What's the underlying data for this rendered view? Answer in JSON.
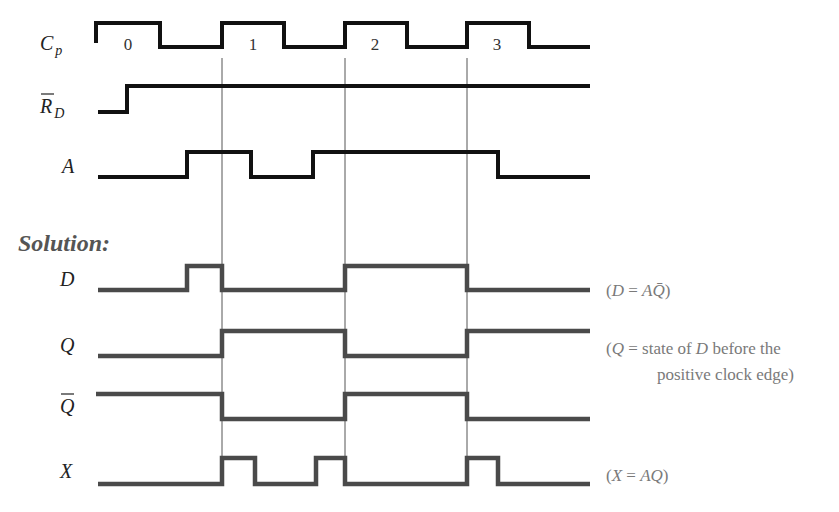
{
  "diagram": {
    "type": "timing_diagram",
    "colors": {
      "input_wave": "#111111",
      "solution_wave": "#4a4a4a",
      "guide_line": "#555555",
      "annotation": "#7a7a7a",
      "heading": "#555555"
    },
    "clock_edges_x": [
      222,
      345,
      467
    ],
    "guide_line_y": [
      58,
      486
    ],
    "clock_cycle_labels": [
      {
        "text": "0",
        "x": 128,
        "y": 50
      },
      {
        "text": "1",
        "x": 253,
        "y": 50
      },
      {
        "text": "2",
        "x": 375,
        "y": 50
      },
      {
        "text": "3",
        "x": 497,
        "y": 50
      }
    ],
    "heading": {
      "text": "Solution:",
      "x": 18,
      "y": 251
    },
    "signals": [
      {
        "id": "cp",
        "group": "input",
        "label": "C",
        "label_sub": "p",
        "label_overbar": false,
        "label_x": 40,
        "label_y": 50,
        "high_y": 23,
        "low_y": 47,
        "points": [
          [
            96,
            43
          ],
          [
            96,
            23
          ],
          [
            160,
            23
          ],
          [
            160,
            47
          ],
          [
            222,
            47
          ],
          [
            222,
            23
          ],
          [
            284,
            23
          ],
          [
            284,
            47
          ],
          [
            345,
            47
          ],
          [
            345,
            23
          ],
          [
            407,
            23
          ],
          [
            407,
            47
          ],
          [
            467,
            47
          ],
          [
            467,
            23
          ],
          [
            529,
            23
          ],
          [
            529,
            47
          ],
          [
            590,
            47
          ]
        ]
      },
      {
        "id": "rd_bar",
        "group": "input",
        "label": "R",
        "label_sub": "D",
        "label_overbar": true,
        "label_x": 40,
        "label_y": 113,
        "high_y": 86,
        "low_y": 112,
        "points": [
          [
            98,
            112
          ],
          [
            127,
            112
          ],
          [
            127,
            86
          ],
          [
            590,
            86
          ]
        ]
      },
      {
        "id": "a",
        "group": "input",
        "label": "A",
        "label_sub": "",
        "label_overbar": false,
        "label_x": 62,
        "label_y": 173,
        "high_y": 152,
        "low_y": 177,
        "points": [
          [
            98,
            177
          ],
          [
            187,
            177
          ],
          [
            187,
            152
          ],
          [
            251,
            152
          ],
          [
            251,
            177
          ],
          [
            313,
            177
          ],
          [
            313,
            152
          ],
          [
            498,
            152
          ],
          [
            498,
            177
          ],
          [
            590,
            177
          ]
        ]
      },
      {
        "id": "d",
        "group": "solution",
        "label": "D",
        "label_sub": "",
        "label_overbar": false,
        "label_x": 60,
        "label_y": 286,
        "high_y": 266,
        "low_y": 290,
        "points": [
          [
            98,
            290
          ],
          [
            187,
            290
          ],
          [
            187,
            266
          ],
          [
            222,
            266
          ],
          [
            222,
            290
          ],
          [
            345,
            290
          ],
          [
            345,
            266
          ],
          [
            467,
            266
          ],
          [
            467,
            290
          ],
          [
            590,
            290
          ]
        ]
      },
      {
        "id": "q",
        "group": "solution",
        "label": "Q",
        "label_sub": "",
        "label_overbar": false,
        "label_x": 60,
        "label_y": 352,
        "high_y": 331,
        "low_y": 356,
        "points": [
          [
            98,
            356
          ],
          [
            222,
            356
          ],
          [
            222,
            331
          ],
          [
            345,
            331
          ],
          [
            345,
            356
          ],
          [
            467,
            356
          ],
          [
            467,
            331
          ],
          [
            590,
            331
          ]
        ]
      },
      {
        "id": "q_bar",
        "group": "solution",
        "label": "Q",
        "label_sub": "",
        "label_overbar": true,
        "label_x": 60,
        "label_y": 413,
        "high_y": 394,
        "low_y": 419,
        "points": [
          [
            96,
            394
          ],
          [
            222,
            394
          ],
          [
            222,
            419
          ],
          [
            345,
            419
          ],
          [
            345,
            394
          ],
          [
            467,
            394
          ],
          [
            467,
            419
          ],
          [
            590,
            419
          ]
        ]
      },
      {
        "id": "x",
        "group": "solution",
        "label": "X",
        "label_sub": "",
        "label_overbar": false,
        "label_x": 60,
        "label_y": 478,
        "high_y": 458,
        "low_y": 484,
        "points": [
          [
            98,
            484
          ],
          [
            222,
            484
          ],
          [
            222,
            458
          ],
          [
            255,
            458
          ],
          [
            255,
            484
          ],
          [
            316,
            484
          ],
          [
            316,
            458
          ],
          [
            345,
            458
          ],
          [
            345,
            484
          ],
          [
            467,
            484
          ],
          [
            467,
            458
          ],
          [
            498,
            458
          ],
          [
            498,
            484
          ],
          [
            590,
            484
          ]
        ]
      }
    ],
    "annotations": [
      {
        "id": "d-eq",
        "x": 606,
        "y": 296,
        "lines": [
          "(D = AQ̄)"
        ],
        "parts": [
          [
            "(",
            false
          ],
          [
            "D",
            true
          ],
          [
            " = ",
            false
          ],
          [
            "A",
            true
          ],
          [
            "Q̄",
            true
          ],
          [
            ")",
            false
          ]
        ]
      },
      {
        "id": "q-eq",
        "x": 606,
        "y": 354,
        "parts": [
          [
            "(",
            false
          ],
          [
            "Q",
            true
          ],
          [
            " = state of ",
            false
          ],
          [
            "D",
            true
          ],
          [
            " before the",
            false
          ]
        ]
      },
      {
        "id": "q-eq-2",
        "x": 657,
        "y": 380,
        "parts": [
          [
            "positive clock edge)",
            false
          ]
        ]
      },
      {
        "id": "x-eq",
        "x": 606,
        "y": 481,
        "parts": [
          [
            "(",
            false
          ],
          [
            "X",
            true
          ],
          [
            " = ",
            false
          ],
          [
            "A",
            true
          ],
          [
            "Q",
            true
          ],
          [
            ")",
            false
          ]
        ]
      }
    ]
  },
  "text": {
    "heading": "Solution:",
    "cycle_0": "0",
    "cycle_1": "1",
    "cycle_2": "2",
    "cycle_3": "3",
    "label_cp": "Cp",
    "label_rd": "R̄D",
    "label_a": "A",
    "label_d": "D",
    "label_q": "Q",
    "label_qbar": "Q̄",
    "label_x": "X",
    "note_d": "(D = AQ̄)",
    "note_q_line1": "(Q = state of D before the",
    "note_q_line2": "positive clock edge)",
    "note_x": "(X = AQ)"
  }
}
